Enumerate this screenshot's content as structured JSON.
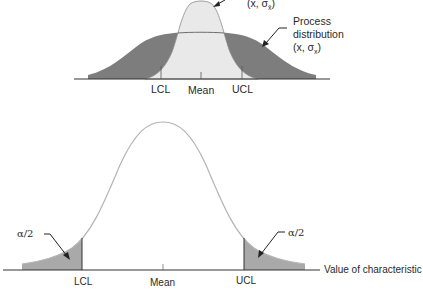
{
  "top_diagram": {
    "sample_distribution_label": "(x̄, σx̄)",
    "sample_label_main": "(x̄, σ",
    "sample_label_sub": "x̄",
    "sample_label_end": ")",
    "process_distribution_label_line1": "Process",
    "process_distribution_label_line2": "distribution",
    "process_label_main": "(x, σ",
    "process_label_sub": "x",
    "process_label_end": ")",
    "axis_labels": {
      "lcl": "LCL",
      "mean": "Mean",
      "ucl": "UCL"
    },
    "colors": {
      "process_fill": "#7d7d7d",
      "sample_fill": "#e9e9e9",
      "outline": "#8a8a8a",
      "axis": "#333333"
    }
  },
  "bottom_diagram": {
    "tail_label_left": "α/2",
    "tail_label_right": "α/2",
    "axis_labels": {
      "lcl": "LCL",
      "mean": "Mean",
      "ucl": "UCL"
    },
    "axis_title": "Value of characteristic",
    "colors": {
      "tail_fill": "#a9a9a9",
      "curve": "#b4b4b4",
      "axis": "#333333"
    }
  }
}
